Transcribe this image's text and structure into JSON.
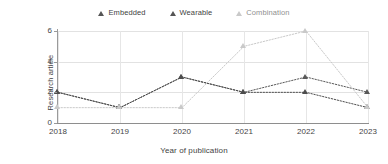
{
  "chart_data": {
    "type": "line",
    "title": "",
    "xlabel": "Year of publication",
    "ylabel": "Research article",
    "categories": [
      "2018",
      "2019",
      "2020",
      "2021",
      "2022",
      "2023"
    ],
    "x": [
      2018,
      2019,
      2020,
      2021,
      2022,
      2023
    ],
    "ylim": [
      0,
      6
    ],
    "yticks": [
      0,
      2,
      4,
      6
    ],
    "grid": "horizontal-and-vertical",
    "legend_position": "top-center",
    "line_style": "dotted",
    "marker": "triangle",
    "series": [
      {
        "name": "Embedded",
        "color": "#595959",
        "values": [
          2,
          1,
          3,
          2,
          3,
          2
        ]
      },
      {
        "name": "Wearable",
        "color": "#4d4d4d",
        "values": [
          2,
          1,
          3,
          2,
          2,
          1
        ]
      },
      {
        "name": "Combination",
        "color": "#c9c9c9",
        "values": [
          1,
          1,
          1,
          5,
          6,
          1
        ]
      }
    ]
  },
  "legend": {
    "items": [
      {
        "label": "Embedded",
        "icon": "triangle-marker-icon"
      },
      {
        "label": "Wearable",
        "icon": "triangle-marker-icon"
      },
      {
        "label": "Combination",
        "icon": "triangle-marker-icon"
      }
    ]
  },
  "axes": {
    "y_title": "Research article",
    "x_title": "Year of publication",
    "y_tick_labels": [
      "0",
      "2",
      "4",
      "6"
    ],
    "x_tick_labels": [
      "2018",
      "2019",
      "2020",
      "2021",
      "2022",
      "2023"
    ]
  }
}
